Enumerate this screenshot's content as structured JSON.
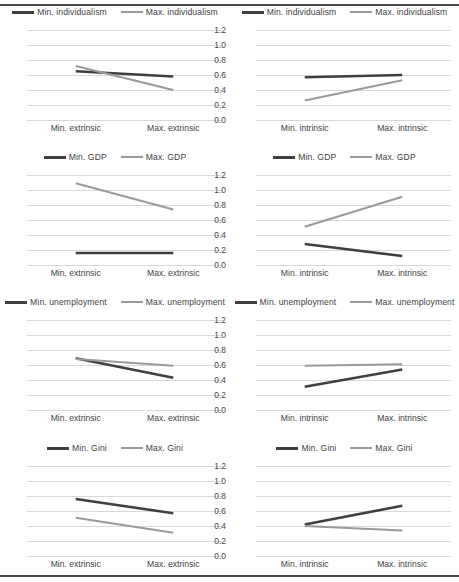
{
  "figure": {
    "rows": 4,
    "cols": 2,
    "rules": [
      "top-rule",
      "bottom-rule"
    ]
  },
  "colors": {
    "min_series": "#3f3f3f",
    "max_series": "#9a9a9a",
    "gridline": "#d9d9d9",
    "rule": "#4a4a4a",
    "text": "#3f3f3f",
    "background": "#ffffff"
  },
  "axis": {
    "yticks": [
      "0.0",
      "0.2",
      "0.4",
      "0.6",
      "0.8",
      "1.0",
      "1.2"
    ],
    "ymin": 0.0,
    "ymax": 1.2,
    "xcats_extrinsic": [
      "Min. extrinsic",
      "Max. extrinsic"
    ],
    "xcats_intrinsic": [
      "Min. intrinsic",
      "Max. intrinsic"
    ]
  },
  "chart_data": [
    {
      "id": "individualism-extrinsic",
      "type": "line",
      "title": "",
      "xlabel": "",
      "ylabel": "",
      "ylim": [
        0.0,
        1.2
      ],
      "grid": true,
      "legend_position": "top",
      "categories": [
        "Min. extrinsic",
        "Max. extrinsic"
      ],
      "series": [
        {
          "name": "Min. individualism",
          "values": [
            0.65,
            0.58
          ],
          "color": "#3f3f3f"
        },
        {
          "name": "Max. individualism",
          "values": [
            0.72,
            0.4
          ],
          "color": "#9a9a9a"
        }
      ]
    },
    {
      "id": "individualism-intrinsic",
      "type": "line",
      "title": "",
      "xlabel": "",
      "ylabel": "",
      "ylim": [
        0.0,
        1.2
      ],
      "grid": true,
      "legend_position": "top",
      "categories": [
        "Min. intrinsic",
        "Max. intrinsic"
      ],
      "series": [
        {
          "name": "Min. individualism",
          "values": [
            0.57,
            0.6
          ],
          "color": "#3f3f3f"
        },
        {
          "name": "Max. individualism",
          "values": [
            0.26,
            0.53
          ],
          "color": "#9a9a9a"
        }
      ]
    },
    {
      "id": "gdp-extrinsic",
      "type": "line",
      "title": "",
      "xlabel": "",
      "ylabel": "",
      "ylim": [
        0.0,
        1.2
      ],
      "grid": true,
      "legend_position": "top",
      "categories": [
        "Min. extrinsic",
        "Max. extrinsic"
      ],
      "series": [
        {
          "name": "Min. GDP",
          "values": [
            0.16,
            0.16
          ],
          "color": "#3f3f3f"
        },
        {
          "name": "Max. GDP",
          "values": [
            1.09,
            0.74
          ],
          "color": "#9a9a9a"
        }
      ]
    },
    {
      "id": "gdp-intrinsic",
      "type": "line",
      "title": "",
      "xlabel": "",
      "ylabel": "",
      "ylim": [
        0.0,
        1.2
      ],
      "grid": true,
      "legend_position": "top",
      "categories": [
        "Min. intrinsic",
        "Max. intrinsic"
      ],
      "series": [
        {
          "name": "Min. GDP",
          "values": [
            0.28,
            0.12
          ],
          "color": "#3f3f3f"
        },
        {
          "name": "Max. GDP",
          "values": [
            0.51,
            0.91
          ],
          "color": "#9a9a9a"
        }
      ]
    },
    {
      "id": "unemployment-extrinsic",
      "type": "line",
      "title": "",
      "xlabel": "",
      "ylabel": "",
      "ylim": [
        0.0,
        1.2
      ],
      "grid": true,
      "legend_position": "top",
      "categories": [
        "Min. extrinsic",
        "Max. extrinsic"
      ],
      "series": [
        {
          "name": "Min. unemployment",
          "values": [
            0.69,
            0.43
          ],
          "color": "#3f3f3f"
        },
        {
          "name": "Max. unemployment",
          "values": [
            0.68,
            0.59
          ],
          "color": "#9a9a9a"
        }
      ]
    },
    {
      "id": "unemployment-intrinsic",
      "type": "line",
      "title": "",
      "xlabel": "",
      "ylabel": "",
      "ylim": [
        0.0,
        1.2
      ],
      "grid": true,
      "legend_position": "top",
      "categories": [
        "Min. intrinsic",
        "Max. intrinsic"
      ],
      "series": [
        {
          "name": "Min. unemployment",
          "values": [
            0.31,
            0.54
          ],
          "color": "#3f3f3f"
        },
        {
          "name": "Max. unemployment",
          "values": [
            0.59,
            0.61
          ],
          "color": "#9a9a9a"
        }
      ]
    },
    {
      "id": "gini-extrinsic",
      "type": "line",
      "title": "",
      "xlabel": "",
      "ylabel": "",
      "ylim": [
        0.0,
        1.2
      ],
      "grid": true,
      "legend_position": "top",
      "categories": [
        "Min. extrinsic",
        "Max. extrinsic"
      ],
      "series": [
        {
          "name": "Min. Gini",
          "values": [
            0.76,
            0.57
          ],
          "color": "#3f3f3f"
        },
        {
          "name": "Max. Gini",
          "values": [
            0.51,
            0.31
          ],
          "color": "#9a9a9a"
        }
      ]
    },
    {
      "id": "gini-intrinsic",
      "type": "line",
      "title": "",
      "xlabel": "",
      "ylabel": "",
      "ylim": [
        0.0,
        1.2
      ],
      "grid": true,
      "legend_position": "top",
      "categories": [
        "Min. intrinsic",
        "Max. intrinsic"
      ],
      "series": [
        {
          "name": "Min. Gini",
          "values": [
            0.42,
            0.67
          ],
          "color": "#3f3f3f"
        },
        {
          "name": "Max. Gini",
          "values": [
            0.4,
            0.34
          ],
          "color": "#9a9a9a"
        }
      ]
    }
  ]
}
